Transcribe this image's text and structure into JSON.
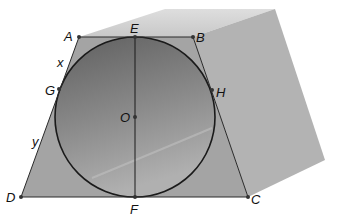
{
  "figure": {
    "colors": {
      "background": "#ffffff",
      "prism_top": "#d4d4d4",
      "prism_side": "#b4b4b4",
      "trapezoid_fill": "#a6a6a6",
      "circle_fill_top": "#6e6e6e",
      "circle_fill_bottom": "#a8a8a8",
      "stroke": "#1a1a1a"
    },
    "points": {
      "A": {
        "label": "A",
        "x": 79,
        "y": 37
      },
      "E": {
        "label": "E",
        "x": 135,
        "y": 37
      },
      "B": {
        "label": "B",
        "x": 193,
        "y": 37
      },
      "G": {
        "label": "G",
        "x": 59,
        "y": 89
      },
      "H": {
        "label": "H",
        "x": 212,
        "y": 90
      },
      "O": {
        "label": "O",
        "x": 135,
        "y": 117
      },
      "D": {
        "label": "D",
        "x": 21,
        "y": 197
      },
      "F": {
        "label": "F",
        "x": 135,
        "y": 197
      },
      "C": {
        "label": "C",
        "x": 248,
        "y": 197
      }
    },
    "segment_labels": {
      "x": {
        "label": "x",
        "segment": "AG"
      },
      "y": {
        "label": "y",
        "segment": "GD"
      }
    },
    "circle": {
      "center": "O",
      "radius": 80
    }
  }
}
